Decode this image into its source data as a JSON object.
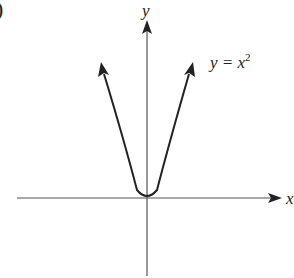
{
  "figure": {
    "partial_label": ")",
    "x_axis_label": "x",
    "y_axis_label": "y",
    "curve_label": {
      "lhs": "y = x",
      "exponent": "2"
    },
    "colors": {
      "axis": "#555555",
      "curve": "#222222",
      "background": "#ffffff"
    }
  }
}
